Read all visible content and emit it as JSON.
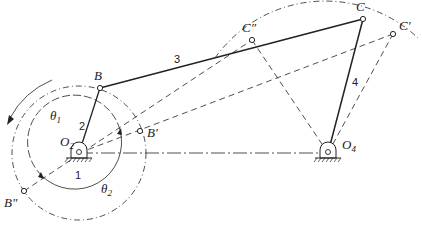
{
  "figure": {
    "type": "four-bar linkage limit positions",
    "points": {
      "O2": {
        "label": "O",
        "sub": "2",
        "x": 79,
        "y": 153
      },
      "O4": {
        "label": "O",
        "sub": "4",
        "x": 328,
        "y": 153
      },
      "B": {
        "label": "B",
        "x": 100,
        "y": 88
      },
      "B_prime": {
        "label": "B′",
        "x": 140,
        "y": 131
      },
      "B_dprime": {
        "label": "B″",
        "x": 24,
        "y": 191
      },
      "C": {
        "label": "C",
        "x": 363,
        "y": 19
      },
      "C_prime": {
        "label": "C′",
        "x": 393,
        "y": 34
      },
      "C_dprime": {
        "label": "C″",
        "x": 252,
        "y": 40
      }
    },
    "links": [
      {
        "id": "1",
        "label": "1",
        "from": "O2",
        "to": "O4",
        "style": "dash-dot"
      },
      {
        "id": "2",
        "label": "2",
        "from": "O2",
        "to": "B",
        "style": "solid"
      },
      {
        "id": "3",
        "label": "3",
        "from": "B",
        "to": "C",
        "style": "solid"
      },
      {
        "id": "4",
        "label": "4",
        "from": "O4",
        "to": "C",
        "style": "solid"
      }
    ],
    "angles": {
      "theta1": {
        "label": "θ",
        "sub": "1"
      },
      "theta2": {
        "label": "θ",
        "sub": "2"
      }
    },
    "colors": {
      "ink": "#222222",
      "background": "#ffffff"
    }
  }
}
